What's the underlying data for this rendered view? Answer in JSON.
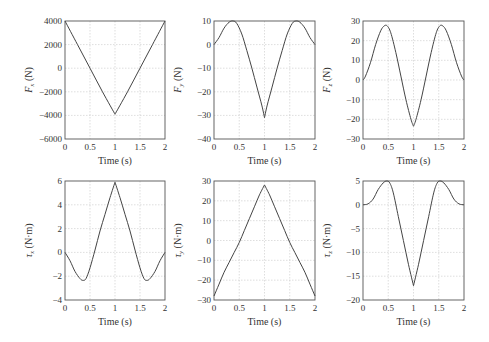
{
  "chart_data": [
    {
      "type": "line",
      "id": "fx",
      "title": "",
      "xlabel": "Time (s)",
      "ylabel_symbol": "F",
      "ylabel_sub": "x",
      "ylabel_unit": "(N)",
      "xlim": [
        0,
        2
      ],
      "ylim": [
        -6000,
        4000
      ],
      "xticks": [
        "0",
        "0.5",
        "1",
        "1.5",
        "2"
      ],
      "yticks": [
        "4000",
        "2000",
        "0",
        "−2000",
        "−4000",
        "−6000"
      ],
      "ytick_values": [
        4000,
        2000,
        0,
        -2000,
        -4000,
        -6000
      ],
      "xtick_values": [
        0,
        0.5,
        1,
        1.5,
        2
      ],
      "grid": true,
      "x": [
        0,
        0.25,
        0.5,
        0.75,
        1.0,
        1.25,
        1.5,
        1.75,
        2.0
      ],
      "y": [
        4000,
        2000,
        0,
        -2000,
        -3900,
        -2000,
        0,
        2000,
        4000
      ]
    },
    {
      "type": "line",
      "id": "fy",
      "title": "",
      "xlabel": "Time (s)",
      "ylabel_symbol": "F",
      "ylabel_sub": "y",
      "ylabel_unit": "(N)",
      "xlim": [
        0,
        2
      ],
      "ylim": [
        -40,
        10
      ],
      "xticks": [
        "0",
        "0.5",
        "1",
        "1.5",
        "2"
      ],
      "yticks": [
        "10",
        "0",
        "−10",
        "−20",
        "−30",
        "−40"
      ],
      "ytick_values": [
        10,
        0,
        -10,
        -20,
        -30,
        -40
      ],
      "xtick_values": [
        0,
        0.5,
        1,
        1.5,
        2
      ],
      "grid": true,
      "x": [
        0,
        0.1,
        0.2,
        0.3,
        0.38,
        0.45,
        0.55,
        0.65,
        0.75,
        0.85,
        0.95,
        1.0,
        1.05,
        1.15,
        1.25,
        1.35,
        1.45,
        1.55,
        1.62,
        1.7,
        1.8,
        1.9,
        2.0
      ],
      "y": [
        0,
        3,
        7,
        9.5,
        10,
        9,
        4.5,
        -2.5,
        -10,
        -18,
        -26,
        -31,
        -26,
        -18,
        -10,
        -2.5,
        4.5,
        9,
        10,
        9.5,
        7,
        3,
        0
      ]
    },
    {
      "type": "line",
      "id": "fz",
      "title": "",
      "xlabel": "Time (s)",
      "ylabel_symbol": "F",
      "ylabel_sub": "z",
      "ylabel_unit": "(N)",
      "xlim": [
        0,
        2
      ],
      "ylim": [
        -30,
        30
      ],
      "xticks": [
        "0",
        "0.5",
        "1",
        "1.5",
        "2"
      ],
      "yticks": [
        "30",
        "20",
        "10",
        "0",
        "−10",
        "−20",
        "−30"
      ],
      "ytick_values": [
        30,
        20,
        10,
        0,
        -10,
        -20,
        -30
      ],
      "xtick_values": [
        0,
        0.5,
        1,
        1.5,
        2
      ],
      "grid": true,
      "x": [
        0,
        0.05,
        0.15,
        0.25,
        0.35,
        0.42,
        0.48,
        0.55,
        0.65,
        0.75,
        0.85,
        0.95,
        1.0,
        1.05,
        1.15,
        1.25,
        1.35,
        1.45,
        1.52,
        1.58,
        1.65,
        1.75,
        1.85,
        1.95,
        2.0
      ],
      "y": [
        0,
        2,
        9,
        18,
        25,
        27.5,
        27.5,
        24,
        14,
        2,
        -10,
        -20,
        -23.5,
        -20,
        -10,
        2,
        14,
        24,
        27.5,
        27.5,
        25,
        18,
        9,
        2,
        0
      ]
    },
    {
      "type": "line",
      "id": "tx",
      "title": "",
      "xlabel": "Time (s)",
      "ylabel_symbol": "τ",
      "ylabel_sub": "x",
      "ylabel_unit": "(N·m)",
      "xlim": [
        0,
        2
      ],
      "ylim": [
        -4,
        6
      ],
      "xticks": [
        "0",
        "0.5",
        "1",
        "1.5",
        "2"
      ],
      "yticks": [
        "6",
        "4",
        "2",
        "0",
        "−2",
        "−4"
      ],
      "ytick_values": [
        6,
        4,
        2,
        0,
        -2,
        -4
      ],
      "xtick_values": [
        0,
        0.5,
        1,
        1.5,
        2
      ],
      "grid": true,
      "x": [
        0,
        0.1,
        0.2,
        0.3,
        0.36,
        0.42,
        0.5,
        0.6,
        0.7,
        0.8,
        0.9,
        1.0,
        1.1,
        1.2,
        1.3,
        1.4,
        1.5,
        1.58,
        1.64,
        1.7,
        1.8,
        1.9,
        2.0
      ],
      "y": [
        0,
        -0.7,
        -1.6,
        -2.2,
        -2.35,
        -2.2,
        -1.3,
        0.2,
        1.8,
        3.2,
        4.6,
        5.9,
        4.6,
        3.2,
        1.8,
        0.2,
        -1.3,
        -2.2,
        -2.35,
        -2.2,
        -1.6,
        -0.7,
        0
      ]
    },
    {
      "type": "line",
      "id": "ty",
      "title": "",
      "xlabel": "Time (s)",
      "ylabel_symbol": "τ",
      "ylabel_sub": "y",
      "ylabel_unit": "(N·m)",
      "xlim": [
        0,
        2
      ],
      "ylim": [
        -30,
        30
      ],
      "xticks": [
        "0",
        "0.5",
        "1",
        "1.5",
        "2"
      ],
      "yticks": [
        "30",
        "20",
        "10",
        "0",
        "−10",
        "−20",
        "−30"
      ],
      "ytick_values": [
        30,
        20,
        10,
        0,
        -10,
        -20,
        -30
      ],
      "xtick_values": [
        0,
        0.5,
        1,
        1.5,
        2
      ],
      "grid": true,
      "x": [
        0,
        0.1,
        0.2,
        0.3,
        0.4,
        0.5,
        0.6,
        0.7,
        0.8,
        0.9,
        1.0,
        1.1,
        1.2,
        1.3,
        1.4,
        1.5,
        1.6,
        1.7,
        1.8,
        1.9,
        2.0
      ],
      "y": [
        -28,
        -22,
        -16,
        -11,
        -6,
        -1,
        5,
        11,
        17,
        23,
        28,
        23,
        17,
        11,
        5,
        -1,
        -6,
        -11,
        -16,
        -22,
        -28
      ]
    },
    {
      "type": "line",
      "id": "tz",
      "title": "",
      "xlabel": "Time (s)",
      "ylabel_symbol": "τ",
      "ylabel_sub": "z",
      "ylabel_unit": "(N·m)",
      "xlim": [
        0,
        2
      ],
      "ylim": [
        -20,
        5
      ],
      "xticks": [
        "0",
        "0.5",
        "1",
        "1.5",
        "2"
      ],
      "yticks": [
        "5",
        "0",
        "−5",
        "−10",
        "−15",
        "−20"
      ],
      "ytick_values": [
        5,
        0,
        -5,
        -10,
        -15,
        -20
      ],
      "xtick_values": [
        0,
        0.5,
        1,
        1.5,
        2
      ],
      "grid": true,
      "x": [
        0,
        0.1,
        0.2,
        0.3,
        0.4,
        0.47,
        0.53,
        0.6,
        0.7,
        0.8,
        0.9,
        1.0,
        1.1,
        1.2,
        1.3,
        1.4,
        1.47,
        1.53,
        1.6,
        1.7,
        1.8,
        1.9,
        2.0
      ],
      "y": [
        0,
        0.2,
        1.2,
        3.2,
        4.6,
        5,
        4.6,
        2.5,
        -2.5,
        -7.5,
        -12.5,
        -17,
        -12.5,
        -7.5,
        -2.5,
        2.5,
        4.6,
        5,
        4.6,
        3.2,
        1.2,
        0.2,
        0
      ]
    }
  ]
}
